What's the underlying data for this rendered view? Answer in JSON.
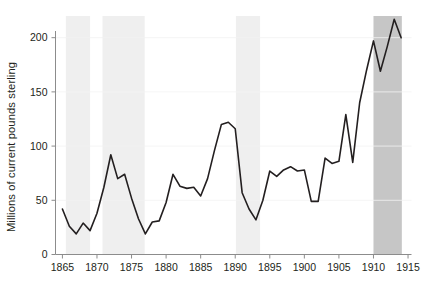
{
  "chart_data": {
    "type": "line",
    "title": "",
    "subtitle": "",
    "xlabel": "",
    "ylabel": "Millions of current pounds sterling",
    "xlim": [
      1864,
      1915.5
    ],
    "ylim": [
      0,
      220
    ],
    "grid": false,
    "legend": null,
    "axis_color": "#8c8c8c",
    "line_color": "#231f20",
    "line_width": 1.6,
    "x_ticks": [
      1865,
      1870,
      1875,
      1880,
      1885,
      1890,
      1895,
      1900,
      1905,
      1910,
      1915
    ],
    "x_tick_labels": [
      "1865",
      "1870",
      "1875",
      "1880",
      "1885",
      "1890",
      "1895",
      "1900",
      "1905",
      "1910",
      "1915"
    ],
    "y_ticks": [
      0,
      50,
      100,
      150,
      200
    ],
    "y_tick_labels": [
      "0",
      "50",
      "100",
      "150",
      "200"
    ],
    "series": [
      {
        "name": "Millions of current pounds sterling",
        "x": [
          1865,
          1866,
          1867,
          1868,
          1869,
          1870,
          1871,
          1872,
          1873,
          1874,
          1875,
          1876,
          1877,
          1878,
          1879,
          1880,
          1881,
          1882,
          1883,
          1884,
          1885,
          1886,
          1887,
          1888,
          1889,
          1890,
          1891,
          1892,
          1893,
          1894,
          1895,
          1896,
          1897,
          1898,
          1899,
          1900,
          1901,
          1902,
          1903,
          1904,
          1905,
          1906,
          1907,
          1908,
          1909,
          1910,
          1911,
          1912,
          1913,
          1914
        ],
        "values": [
          42,
          26,
          19,
          29,
          22,
          38,
          62,
          92,
          70,
          74,
          52,
          33,
          19,
          30,
          31,
          48,
          74,
          63,
          61,
          62,
          54,
          70,
          96,
          120,
          122,
          116,
          57,
          42,
          32,
          50,
          77,
          72,
          78,
          81,
          77,
          78,
          49,
          49,
          89,
          84,
          86,
          129,
          85,
          140,
          170,
          197,
          169,
          192,
          217,
          200
        ]
      }
    ],
    "shaded_bands": [
      {
        "name": "band-1",
        "x0": 1865.5,
        "x1": 1869.0,
        "color": "#efefef"
      },
      {
        "name": "band-2",
        "x0": 1870.8,
        "x1": 1876.9,
        "color": "#efefef"
      },
      {
        "name": "band-3",
        "x0": 1890.1,
        "x1": 1893.6,
        "color": "#efefef"
      },
      {
        "name": "band-4",
        "x0": 1910.0,
        "x1": 1914.1,
        "color": "#c6c6c6"
      }
    ]
  }
}
